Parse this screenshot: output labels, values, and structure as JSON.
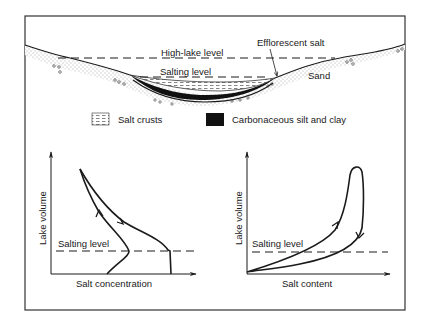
{
  "cross_section": {
    "labels": {
      "high_lake_level": "High-lake level",
      "salting_level": "Salting level",
      "efflorescent_salt": "Efflorescent salt",
      "sand": "Sand"
    }
  },
  "legend": {
    "items": [
      {
        "pattern": "dashed-hatch",
        "label": "Salt crusts"
      },
      {
        "pattern": "solid-black",
        "label": "Carbonaceous silt and clay"
      }
    ]
  },
  "graphs": {
    "left": {
      "ylabel": "Lake volume",
      "xlabel": "Salt concentration",
      "threshold_label": "Salting level"
    },
    "right": {
      "ylabel": "Lake volume",
      "xlabel": "Salt content",
      "threshold_label": "Salting level"
    }
  },
  "colors": {
    "ink": "#1a1a1a",
    "background": "#ffffff",
    "frame": "#333333"
  }
}
